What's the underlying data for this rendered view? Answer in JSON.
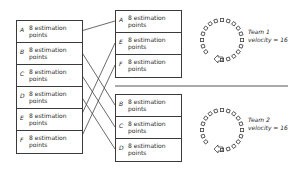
{
  "left_column": {
    "items": [
      {
        "letter": "A",
        "points": "8 estimation",
        "unit": "points"
      },
      {
        "letter": "B",
        "points": "8 estimation",
        "unit": "points"
      },
      {
        "letter": "C",
        "points": "8 estimation",
        "unit": "points"
      },
      {
        "letter": "D",
        "points": "8 estimation",
        "unit": "points"
      },
      {
        "letter": "E",
        "points": "8 estimation",
        "unit": "points"
      },
      {
        "letter": "F",
        "points": "8 estimation",
        "unit": "points"
      }
    ]
  },
  "team1": {
    "items": [
      {
        "letter": "A",
        "points": "8 estimation",
        "unit": "points"
      },
      {
        "letter": "E",
        "points": "8 estimation",
        "unit": "points"
      },
      {
        "letter": "F",
        "points": "8 estimation",
        "unit": "points"
      }
    ],
    "label": "Team 1",
    "velocity": "velocity = 16",
    "icon": "sprint-cycle-icon"
  },
  "team2": {
    "items": [
      {
        "letter": "B",
        "points": "8 estimation",
        "unit": "points"
      },
      {
        "letter": "C",
        "points": "8 estimation",
        "unit": "points"
      },
      {
        "letter": "D",
        "points": "8 estimation",
        "unit": "points"
      }
    ],
    "label": "Team 2",
    "velocity": "velocity = 16",
    "icon": "sprint-cycle-icon"
  },
  "connections": [
    {
      "from": "A",
      "to": "Team 1 A"
    },
    {
      "from": "B",
      "to": "Team 2 B"
    },
    {
      "from": "C",
      "to": "Team 2 C"
    },
    {
      "from": "D",
      "to": "Team 2 D"
    },
    {
      "from": "E",
      "to": "Team 1 E"
    },
    {
      "from": "F",
      "to": "Team 1 F"
    }
  ]
}
